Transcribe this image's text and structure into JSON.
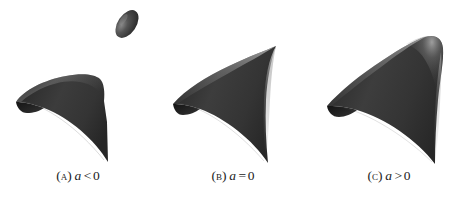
{
  "figure": {
    "background_color": "#ffffff",
    "surface_color": "#383838",
    "surface_highlight_color": "#9a9a9a",
    "surface_shadow_color": "#1e1e1e",
    "caption_color": "#1b1b1b"
  },
  "panels": [
    {
      "id": "a",
      "caption_tag": "(A)",
      "caption_var": "a",
      "caption_relation": "<",
      "caption_value": "0",
      "caption_full": "(A) a < 0",
      "surface_name": "cone-with-detached-ellipsoid",
      "components": [
        "ellipsoid",
        "cone-sheet"
      ]
    },
    {
      "id": "b",
      "caption_tag": "(B)",
      "caption_var": "a",
      "caption_relation": "=",
      "caption_value": "0",
      "caption_full": "(B) a = 0",
      "surface_name": "cone-with-sharp-cusp",
      "components": [
        "cone-sheet-cusped"
      ]
    },
    {
      "id": "c",
      "caption_tag": "(C)",
      "caption_var": "a",
      "caption_relation": ">",
      "caption_value": "0",
      "caption_full": "(C) a > 0",
      "surface_name": "smooth-rounded-surface",
      "components": [
        "smooth-sheet"
      ]
    }
  ]
}
